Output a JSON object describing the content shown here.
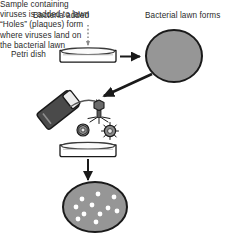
{
  "figure": {
    "type": "diagram",
    "background_color": "#ffffff",
    "text_color": "#2b2b2b",
    "ink_color": "#1a1a1a",
    "lawn_fill": "#969696",
    "tube_fill": "#4a4a4a",
    "plaque_fill": "#ffffff"
  },
  "labels": {
    "bacteria_added": "Bacteria added",
    "lawn_forms": "Bacterial lawn forms",
    "petri_dish": "Petri dish",
    "sample_line1": "Sample containing",
    "sample_line2": "viruses is added to lawn",
    "plaques_line1": "“Holes” (plaques) form",
    "plaques_line2": "where viruses land on",
    "plaques_line3": "the bacterial lawn"
  },
  "icons": {
    "dotted_down_arrow": "dotted-arrow-down-icon",
    "petri_dish_side": "petri-dish-side-icon",
    "lawn_circle": "bacterial-lawn-icon",
    "solid_arrow_right": "arrow-right-icon",
    "solid_arrow_diagonal": "arrow-diagonal-icon",
    "curved_arrow": "curved-arrow-icon",
    "tube": "sample-tube-icon",
    "bacteriophage": "bacteriophage-icon",
    "virus_particle": "virus-particle-icon",
    "plaque_dish": "plaque-dish-icon",
    "arrow_down": "arrow-down-icon"
  },
  "chart_data": {
    "type": "diagram",
    "steps": [
      {
        "order": 1,
        "caption": "Bacteria added",
        "element": "petri-dish-side"
      },
      {
        "order": 2,
        "caption": "Bacterial lawn forms",
        "element": "bacterial-lawn"
      },
      {
        "order": 3,
        "caption": "Sample containing viruses is added to lawn",
        "element": "sample-tube"
      },
      {
        "order": 4,
        "caption": "“Holes” (plaques) form where viruses land on the bacterial lawn",
        "element": "plaque-dish"
      }
    ],
    "plaque_count": 11,
    "plaque_positions": [
      [
        82,
        199
      ],
      [
        98,
        194
      ],
      [
        114,
        197
      ],
      [
        76,
        207
      ],
      [
        92,
        205
      ],
      [
        108,
        208
      ],
      [
        84,
        214
      ],
      [
        100,
        214
      ],
      [
        117,
        211
      ],
      [
        78,
        219
      ],
      [
        96,
        222
      ]
    ],
    "virus_particle_count": 2,
    "bacteriophage_count": 1
  }
}
